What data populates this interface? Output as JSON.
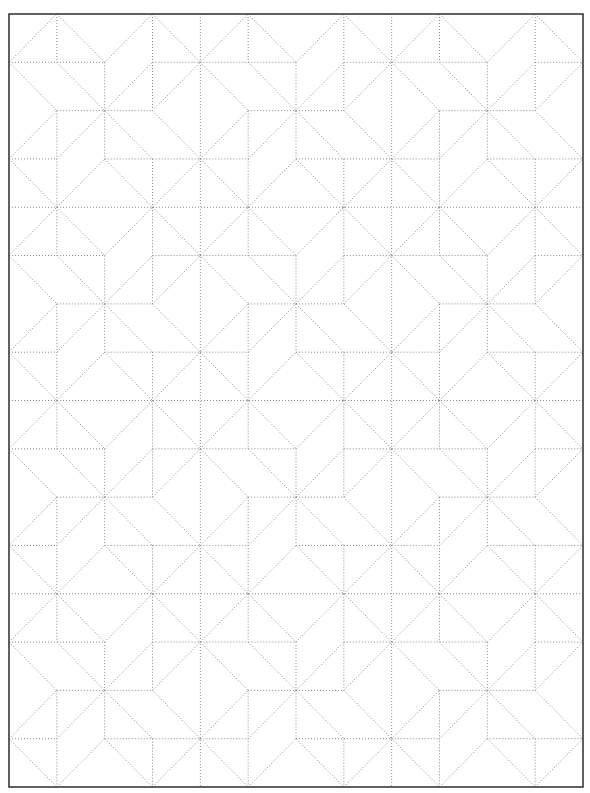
{
  "page": {
    "background": "#ffffff"
  },
  "frame": {
    "x": 9,
    "y": 14,
    "width": 574,
    "height": 773,
    "stroke": "#3a3a3a",
    "stroke_width": 1.6
  },
  "grid": {
    "columns": 12,
    "rows": 16,
    "block_size": 4,
    "block_columns": 3,
    "block_rows": 4
  },
  "lines": {
    "stroke": "#8a8a8a",
    "stroke_width": 1,
    "dash": "1 2"
  },
  "block_pattern": {
    "name": "pinwheel-star",
    "edges": [
      [
        [
          0,
          1
        ],
        [
          1,
          0
        ]
      ],
      [
        [
          1,
          0
        ],
        [
          2,
          1
        ]
      ],
      [
        [
          1,
          0
        ],
        [
          1,
          1
        ]
      ],
      [
        [
          0,
          1
        ],
        [
          2,
          1
        ]
      ],
      [
        [
          2,
          1
        ],
        [
          2,
          2
        ]
      ],
      [
        [
          0,
          1
        ],
        [
          1,
          2
        ]
      ],
      [
        [
          1,
          1
        ],
        [
          2,
          2
        ]
      ],
      [
        [
          1,
          2
        ],
        [
          2,
          2
        ]
      ],
      [
        [
          2,
          1
        ],
        [
          3,
          0
        ]
      ],
      [
        [
          3,
          0
        ],
        [
          4,
          1
        ]
      ],
      [
        [
          3,
          0
        ],
        [
          3,
          2
        ]
      ],
      [
        [
          3,
          1
        ],
        [
          4,
          1
        ]
      ],
      [
        [
          2,
          2
        ],
        [
          3,
          1
        ]
      ],
      [
        [
          3,
          2
        ],
        [
          4,
          1
        ]
      ],
      [
        [
          2,
          2
        ],
        [
          3,
          2
        ]
      ],
      [
        [
          0,
          3
        ],
        [
          1,
          2
        ]
      ],
      [
        [
          1,
          3
        ],
        [
          2,
          2
        ]
      ],
      [
        [
          1,
          2
        ],
        [
          1,
          4
        ]
      ],
      [
        [
          0,
          3
        ],
        [
          1,
          3
        ]
      ],
      [
        [
          0,
          3
        ],
        [
          1,
          4
        ]
      ],
      [
        [
          1,
          4
        ],
        [
          2,
          3
        ]
      ],
      [
        [
          2,
          2
        ],
        [
          3,
          3
        ]
      ],
      [
        [
          3,
          2
        ],
        [
          4,
          3
        ]
      ],
      [
        [
          2,
          3
        ],
        [
          4,
          3
        ]
      ],
      [
        [
          3,
          3
        ],
        [
          3,
          4
        ]
      ],
      [
        [
          2,
          3
        ],
        [
          3,
          4
        ]
      ],
      [
        [
          3,
          4
        ],
        [
          4,
          3
        ]
      ],
      [
        [
          2,
          2
        ],
        [
          2,
          3
        ]
      ]
    ],
    "boundary_lines": true
  }
}
